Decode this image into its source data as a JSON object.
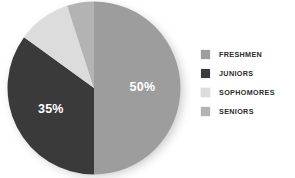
{
  "chart_data": {
    "type": "pie",
    "title": "",
    "categories": [
      "FRESHMEN",
      "JUNIORS",
      "SOPHOMORES",
      "SENIORS"
    ],
    "values": [
      50,
      35,
      10,
      5
    ],
    "value_unit": "%",
    "slice_labels": [
      "50%",
      "35%",
      "",
      ""
    ],
    "colors": [
      "#9d9d9d",
      "#3a3a3a",
      "#dcdcdc",
      "#b3b3b3"
    ],
    "legend_position": "right",
    "grid": false,
    "start_angle_deg": 0,
    "direction": "clockwise",
    "slices": [
      {
        "name": "FRESHMEN",
        "value": 50,
        "label": "50%",
        "color": "#9d9d9d",
        "label_color": "#ffffff"
      },
      {
        "name": "JUNIORS",
        "value": 35,
        "label": "35%",
        "color": "#3a3a3a",
        "label_color": "#ffffff"
      },
      {
        "name": "SOPHOMORES",
        "value": 10,
        "label": "",
        "color": "#dcdcdc",
        "label_color": "#ffffff"
      },
      {
        "name": "SENIORS",
        "value": 5,
        "label": "",
        "color": "#b3b3b3",
        "label_color": "#ffffff"
      }
    ]
  },
  "legend": {
    "items": [
      {
        "label": "FRESHMEN",
        "color": "#9d9d9d"
      },
      {
        "label": "JUNIORS",
        "color": "#3a3a3a"
      },
      {
        "label": "SOPHOMORES",
        "color": "#dcdcdc"
      },
      {
        "label": "SENIORS",
        "color": "#b3b3b3"
      }
    ]
  }
}
